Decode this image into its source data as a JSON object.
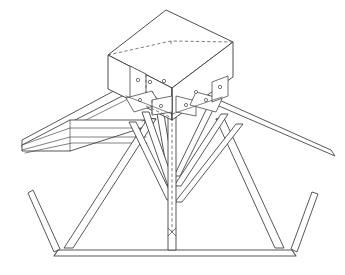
{
  "drawing": {
    "title": "Axonometric detail of timber truss apex joint with cubic node block",
    "subject": "roof-truss-node-connection",
    "projection": "axonometric",
    "background_color": "#ffffff",
    "line_color": "#3a3a3a",
    "hidden_line_color": "#5a5a5a",
    "line_style": "monochrome-ink-line-drawing",
    "fill": "none",
    "labels": [],
    "annotations": [],
    "dimensions_shown": false
  },
  "components": {
    "node_block": {
      "name": "central-cube-node-block",
      "shape": "cube",
      "visible_faces": [
        "top",
        "left",
        "right"
      ],
      "hidden_edges": 3,
      "top_face": {
        "points": "166,10 233,42 172,88 108,55",
        "note": "rhombus top face of cube"
      },
      "left_face": {
        "points": "108,55 172,88 172,120 108,88",
        "note": "left vertical face in shade"
      },
      "right_face": {
        "points": "172,88 233,42 233,76 172,120",
        "note": "right vertical face"
      }
    },
    "connector_plates": {
      "name": "steel-gusset-plates",
      "count": 8,
      "bolt_holes_total": 14,
      "hole_radius": 1.6
    },
    "members": [
      {
        "name": "left-rafter-top-chord",
        "type": "sloping-beam",
        "direction": "down-left"
      },
      {
        "name": "right-rafter-top-chord",
        "type": "sloping-beam",
        "direction": "down-right"
      },
      {
        "name": "left-horizontal-purlin-plate",
        "type": "flat-plate",
        "direction": "horizontal-left"
      },
      {
        "name": "left-inner-strut",
        "type": "diagonal-strut",
        "direction": "down-left"
      },
      {
        "name": "right-inner-strut",
        "type": "diagonal-strut",
        "direction": "down-right"
      },
      {
        "name": "left-chevron-brace-upper",
        "type": "v-brace"
      },
      {
        "name": "right-chevron-brace-upper",
        "type": "v-brace"
      },
      {
        "name": "left-chevron-brace-lower",
        "type": "v-brace"
      },
      {
        "name": "right-chevron-brace-lower",
        "type": "v-brace"
      },
      {
        "name": "central-vertical-post",
        "type": "king-post",
        "direction": "vertical"
      },
      {
        "name": "bottom-tie-chord",
        "type": "horizontal-beam",
        "direction": "horizontal"
      },
      {
        "name": "left-outer-raking-strut",
        "type": "diagonal-strut",
        "direction": "up-left"
      },
      {
        "name": "right-outer-raking-strut",
        "type": "diagonal-strut",
        "direction": "up-right"
      }
    ]
  }
}
